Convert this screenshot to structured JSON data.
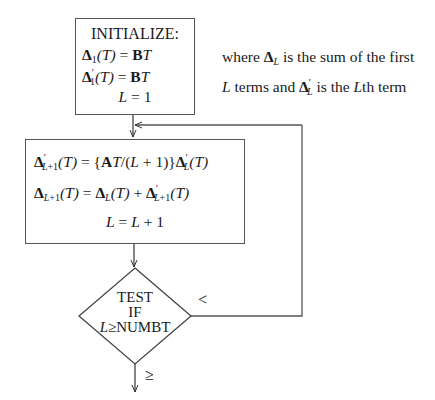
{
  "flowchart": {
    "init_box": {
      "title": "INITIALIZE:",
      "lines": [
        {
          "lhs_sym": "Δ",
          "lhs_sub": "1",
          "lhs_prime": "",
          "lhs_arg": "(T)",
          "rhs_bold": "B",
          "rhs_ital": "T"
        },
        {
          "lhs_sym": "Δ",
          "lhs_sub": "1",
          "lhs_prime": "′",
          "lhs_arg": "(T)",
          "rhs_bold": "B",
          "rhs_ital": "T"
        }
      ],
      "last_line": {
        "lhs": "L",
        "rhs": "1"
      }
    },
    "note": {
      "line1_pre": "where ",
      "line1_sym": "Δ",
      "line1_sub": "L",
      "line1_post": " is the sum of the first",
      "line2_var": "L",
      "line2_mid": " terms and ",
      "line2_sym": "Δ",
      "line2_prime": "′",
      "line2_sub": "L",
      "line2_mid2": " is the ",
      "line2_var2": "L",
      "line2_post": "th term"
    },
    "loop_box": {
      "eq1": "Δ′L+1(T) = {AT/(L + 1)}Δ′L(T)",
      "eq2": "ΔL+1(T) = ΔL(T) + Δ′L+1(T)",
      "eq3": "L = L + 1"
    },
    "decision": {
      "line1": "TEST",
      "line2": "IF",
      "line3_var": "L",
      "line3_rest": "≥NUMBT",
      "branch_false_label": "<",
      "branch_true_label": "≥"
    }
  }
}
